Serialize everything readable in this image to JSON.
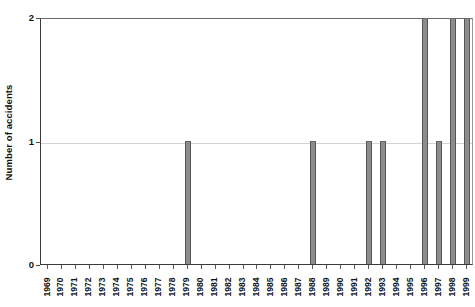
{
  "chart_data": {
    "type": "bar",
    "title": "",
    "xlabel": "",
    "ylabel": "Number of accidents",
    "categories": [
      "1969",
      "1970",
      "1971",
      "1972",
      "1973",
      "1974",
      "1975",
      "1976",
      "1977",
      "1978",
      "1979",
      "1980",
      "1981",
      "1982",
      "1983",
      "1984",
      "1985",
      "1986",
      "1987",
      "1988",
      "1989",
      "1990",
      "1991",
      "1992",
      "1993",
      "1994",
      "1995",
      "1996",
      "1997",
      "1998",
      "1999"
    ],
    "values": [
      0,
      0,
      0,
      0,
      0,
      0,
      0,
      0,
      0,
      0,
      1,
      0,
      0,
      0,
      0,
      0,
      0,
      0,
      0,
      1,
      0,
      0,
      0,
      1,
      1,
      0,
      0,
      2,
      1,
      2,
      2
    ],
    "ylim": [
      0,
      2
    ],
    "y_ticks": [
      "0",
      "1",
      "2"
    ],
    "grid": true,
    "legend": "none",
    "bar_color": "#8c8c8c",
    "bar_edge_color": "#555555",
    "axis_color": "#3a3a3a",
    "gridline_color": "#d4d4d4",
    "background": "#ffffff"
  }
}
